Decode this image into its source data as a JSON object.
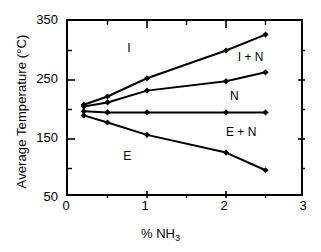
{
  "chart_data": {
    "type": "line",
    "title": "",
    "xlabel": "% NH3",
    "xlabel_display": "% NH",
    "xlabel_subscript": "3",
    "ylabel": "Average Temperature (°C)",
    "xlim": [
      0,
      3
    ],
    "ylim": [
      50,
      350
    ],
    "xticks": [
      0,
      1,
      2,
      3
    ],
    "xtick_labels": [
      "0",
      "1",
      "2",
      "3"
    ],
    "xminor_ticks": [
      0.5,
      1.5,
      2.5
    ],
    "yticks": [
      50,
      150,
      250,
      350
    ],
    "ytick_labels": [
      "50",
      "150",
      "250",
      "350"
    ],
    "yminor_ticks": [
      100,
      200,
      300
    ],
    "grid": false,
    "legend": "none",
    "marker": "filled-diamond",
    "series": [
      {
        "name": "I / I+N boundary",
        "x": [
          0.2,
          0.5,
          1.0,
          2.0,
          2.5
        ],
        "y": [
          208,
          222,
          253,
          300,
          327
        ]
      },
      {
        "name": "I+N / N boundary",
        "x": [
          0.2,
          0.5,
          1.0,
          2.0,
          2.5
        ],
        "y": [
          205,
          212,
          232,
          248,
          263
        ]
      },
      {
        "name": "N / E+N boundary",
        "x": [
          0.2,
          0.5,
          1.0,
          2.0,
          2.5
        ],
        "y": [
          197,
          195,
          195,
          195,
          195
        ]
      },
      {
        "name": "E / E+N boundary",
        "x": [
          0.2,
          0.5,
          1.0,
          2.0,
          2.5
        ],
        "y": [
          190,
          178,
          157,
          127,
          97
        ]
      }
    ],
    "region_labels": [
      {
        "text": "I",
        "x": 0.75,
        "y": 302
      },
      {
        "text": "I + N",
        "x": 2.15,
        "y": 288
      },
      {
        "text": "N",
        "x": 2.05,
        "y": 222
      },
      {
        "text": "E + N",
        "x": 2.0,
        "y": 160
      },
      {
        "text": "E",
        "x": 0.7,
        "y": 120
      }
    ],
    "colors": {
      "line": "#000000",
      "marker": "#000000",
      "axis": "#000000",
      "background": "#ffffff"
    }
  }
}
